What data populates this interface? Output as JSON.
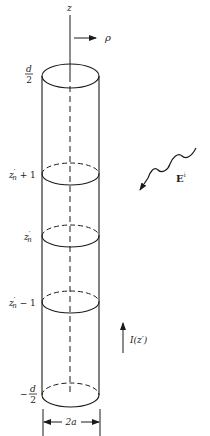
{
  "figure": {
    "type": "cylindrical dipole wire antenna geometry",
    "axis_labels": {
      "z": "z",
      "rho": "ρ"
    },
    "top_label": {
      "sign": "",
      "numerator": "d",
      "denominator": "2"
    },
    "bottom_label": {
      "sign": "−",
      "numerator": "d",
      "denominator": "2"
    },
    "segment_labels": [
      {
        "base": "z",
        "prime": "′",
        "sub": "n",
        "suffix": " + 1"
      },
      {
        "base": "z",
        "prime": "′",
        "sub": "n",
        "suffix": ""
      },
      {
        "base": "z",
        "prime": "′",
        "sub": "n",
        "suffix": " − 1"
      }
    ],
    "diameter_label": "2a",
    "incident_field": {
      "base": "E",
      "sup": "i"
    },
    "current_label": "I(z′)",
    "colors": {
      "ink": "#1a1a1a",
      "background": "#ffffff"
    }
  }
}
